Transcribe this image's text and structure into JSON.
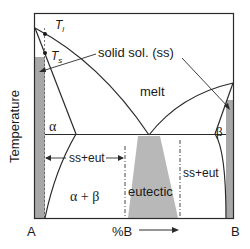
{
  "diagram": {
    "type": "binary eutectic phase diagram",
    "axes": {
      "y_label": "Temperature",
      "x_label": "%B",
      "x_left": "A",
      "x_right": "B",
      "x_arrow": "→"
    },
    "labels": {
      "t_liquidus": "T",
      "t_liquidus_sub": "l",
      "t_solidus": "T",
      "t_solidus_sub": "s",
      "solid_solution": "solid sol. (ss)",
      "melt": "melt",
      "alpha": "α",
      "beta": "β",
      "alpha_beta": "α + β",
      "ss_eut_left": "ss+eut",
      "ss_eut_right": "ss+eut",
      "eutectic": "eutectic"
    },
    "colors": {
      "line": "#2a2a2a",
      "shade": "#a8a8a8",
      "background": "#ffffff"
    }
  }
}
